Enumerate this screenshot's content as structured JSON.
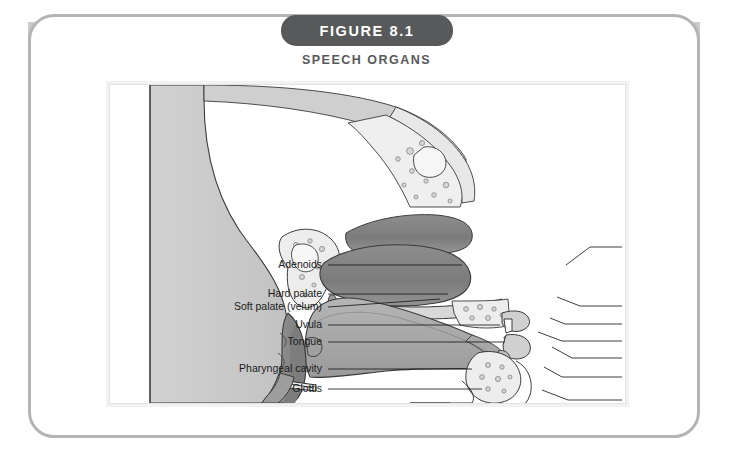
{
  "figure": {
    "badge_label": "FIGURE 8.1",
    "subtitle": "SPEECH ORGANS"
  },
  "colors": {
    "badge_bg": "#58595b",
    "header_band": "#c9cacc",
    "outer_border": "#b3b4b6",
    "panel_border": "#e2e3e4",
    "skin_fill": "#c9c9c9",
    "tissue_dark": "#8a8a8a",
    "tissue_mid": "#a6a6a6",
    "bone_fill": "#ededed",
    "outline": "#3a3a3a",
    "label_text": "#1b1b1b"
  },
  "diagram": {
    "title": "Speech Organs",
    "type": "anatomical-sagittal-section",
    "left_labels": [
      {
        "id": "adenoids",
        "text": "Adenoids",
        "text_x": 212,
        "text_y": 183,
        "leader": [
          [
            218,
            180
          ],
          [
            352,
            180
          ]
        ]
      },
      {
        "id": "hard-palate",
        "text": "Hard palate",
        "text_x": 212,
        "text_y": 212,
        "leader": [
          [
            218,
            209
          ],
          [
            338,
            209
          ]
        ]
      },
      {
        "id": "soft-palate",
        "text": "Soft palate (velum)",
        "text_x": 212,
        "text_y": 225,
        "leader": [
          [
            218,
            222
          ],
          [
            330,
            214
          ]
        ]
      },
      {
        "id": "uvula",
        "text": "Uvula",
        "text_x": 212,
        "text_y": 243,
        "leader": [
          [
            218,
            240
          ],
          [
            390,
            240
          ]
        ]
      },
      {
        "id": "tongue",
        "text": "Tongue",
        "text_x": 212,
        "text_y": 260,
        "leader": [
          [
            218,
            257
          ],
          [
            395,
            257
          ]
        ]
      },
      {
        "id": "pharyngeal-cavity",
        "text": "Pharyngeal cavity",
        "text_x": 212,
        "text_y": 287,
        "leader": [
          [
            218,
            284
          ],
          [
            362,
            284
          ]
        ]
      },
      {
        "id": "glottis",
        "text": "Glottis",
        "text_x": 212,
        "text_y": 307,
        "leader": [
          [
            218,
            304
          ],
          [
            372,
            304
          ]
        ]
      },
      {
        "id": "vocal-folds",
        "text": "Vocal folds",
        "text_x": 212,
        "text_y": 339,
        "leader": [
          [
            218,
            336
          ],
          [
            372,
            327
          ]
        ]
      }
    ],
    "right_labels": [
      {
        "id": "nasal-passages",
        "text": "Nasal passages",
        "text_x": 516,
        "text_y": 165,
        "leader": [
          [
            512,
            162
          ],
          [
            480,
            162
          ],
          [
            456,
            180
          ]
        ]
      },
      {
        "id": "alveolar-ridge",
        "text": "Alveolar ridge",
        "text_x": 516,
        "text_y": 224,
        "leader": [
          [
            512,
            221
          ],
          [
            470,
            221
          ],
          [
            447,
            212
          ]
        ]
      },
      {
        "id": "upper-lip",
        "text": "Upper lip",
        "text_x": 516,
        "text_y": 242,
        "leader": [
          [
            512,
            239
          ],
          [
            455,
            239
          ],
          [
            440,
            233
          ]
        ]
      },
      {
        "id": "teeth",
        "text": "Teeth",
        "text_x": 516,
        "text_y": 259,
        "leader": [
          [
            512,
            256
          ],
          [
            452,
            256
          ],
          [
            428,
            247
          ]
        ]
      },
      {
        "id": "lower-lip",
        "text": "Lower lip",
        "text_x": 516,
        "text_y": 276,
        "leader": [
          [
            512,
            273
          ],
          [
            462,
            273
          ],
          [
            442,
            262
          ]
        ]
      },
      {
        "id": "frenum",
        "text": "Frenum",
        "text_x": 516,
        "text_y": 295,
        "leader": [
          [
            512,
            292
          ],
          [
            452,
            292
          ],
          [
            434,
            282
          ]
        ]
      },
      {
        "id": "mandible-jaw",
        "text": "Mandible (jaw)",
        "text_x": 516,
        "text_y": 318,
        "leader": [
          [
            512,
            315
          ],
          [
            458,
            315
          ],
          [
            432,
            305
          ]
        ]
      },
      {
        "id": "larynx",
        "text": "Larynx",
        "text_x": 516,
        "text_y": 355,
        "leader": [
          [
            512,
            352
          ],
          [
            400,
            352
          ],
          [
            372,
            335
          ]
        ]
      }
    ]
  }
}
